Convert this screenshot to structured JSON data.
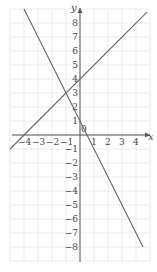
{
  "chart_data": {
    "type": "line",
    "title": "",
    "xlabel": "x",
    "ylabel": "y",
    "xlim": [
      -5,
      5
    ],
    "ylim": [
      -9,
      9
    ],
    "grid": true,
    "x_ticks": [
      "-4",
      "-3",
      "-2",
      "-1",
      "0",
      "1",
      "2",
      "3",
      "4"
    ],
    "y_ticks": [
      "8",
      "7",
      "6",
      "5",
      "4",
      "3",
      "2",
      "1",
      "-1",
      "-2",
      "-3",
      "-4",
      "-5",
      "-6",
      "-7",
      "-8"
    ],
    "series": [
      {
        "name": "y = x + 4",
        "x": [
          -5,
          4.8
        ],
        "y": [
          -1,
          8.8
        ]
      },
      {
        "name": "y = -2x + 1",
        "x": [
          -4,
          4.5
        ],
        "y": [
          9,
          -8
        ]
      }
    ],
    "intersection": {
      "x": -1,
      "y": 3
    }
  },
  "axes": {
    "x_label": "x",
    "y_label": "y",
    "origin_label": "0"
  }
}
